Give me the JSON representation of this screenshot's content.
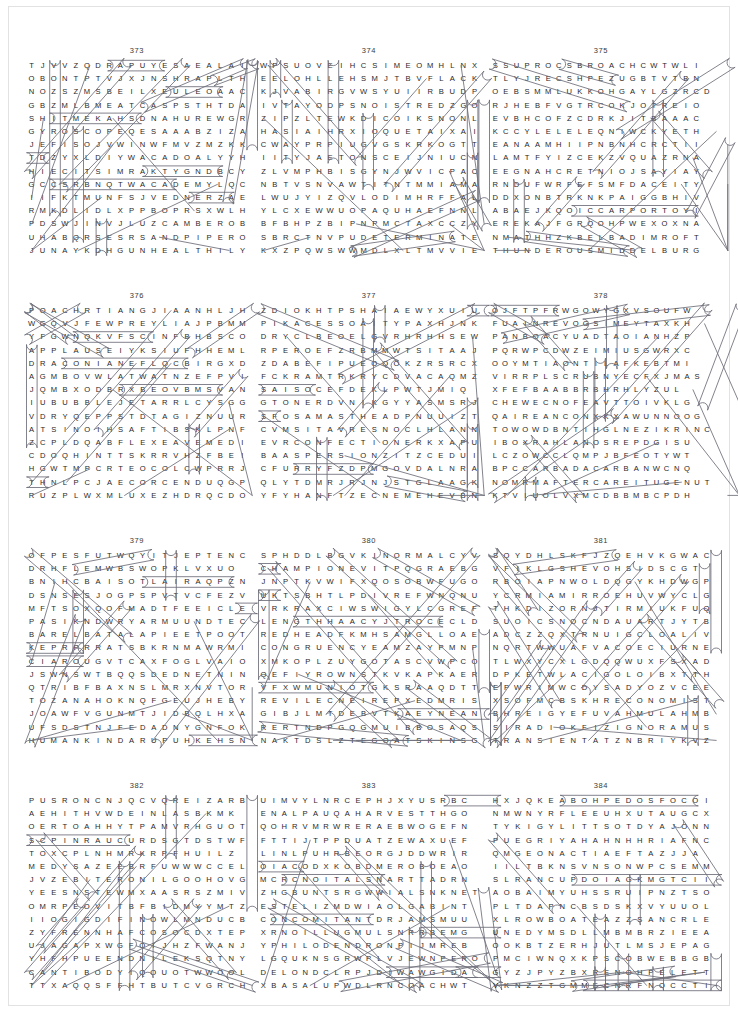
{
  "page": {
    "kind": "word-search-puzzle-sheet",
    "layout": {
      "rows": 4,
      "columns": 3,
      "puzzles_total": 12
    },
    "first_puzzle_number": "373",
    "last_puzzle_number": "384"
  },
  "puzzles": [
    {
      "number": "373",
      "grid": [
        "TJVVZQDRAPUYESAEALAI",
        "OBONTPTVJXJNSHRAPLTH",
        "NOZSZMSBEILXEULEOAAC",
        "GBZMLBMEATCASPSTHTDA",
        "SHITMEKAHSDNAHUREWGR",
        "GYROSCOPEQESAAABZIZA",
        "JEFISOJVWINWFMVZMZKK",
        "TDZYXLDIYWACADOALYYH",
        "HIECITSIMRAKTYGNDBCY",
        "GCCSRBNQTWACADEMYLQC",
        "IIFKTMUNFSJVEDNERZAE",
        "RMKDLIDLXPPBOPRSXWLH",
        "PDSWJINVJLUZCAMBEROB",
        "UHABQRSESRSANDPIPERO",
        "JUNAYKDHGUNHEALTHILY"
      ],
      "found_words": [
        "GYROSCOPE",
        "SANDHANDS",
        "CAMBER",
        "SANDPIPER",
        "UNHEALTHILY",
        "ACADEMY",
        "KARMISTICE",
        "GOSSIP",
        "TONGS",
        "STONING"
      ]
    },
    {
      "number": "374",
      "grid": [
        "WPSUOVEIHCSIMEOMHLNX",
        "EELOHLLEHSMJTBVFLACK",
        "KJVABIRGVWSYUIIRBUDP",
        "IVTAYODPSNOISTREDZGO",
        "ZIPZLTEWKDICOIKSNONL",
        "HASIAIHRXIOQUETAIXAI",
        "CWAYPRPIUGVGSKRKOGTT",
        "IITYJAETONSCEIJNIUCN",
        "ZLVMPHBISGYNJWVICPAC",
        "NBTVSNVAWTITNTMMIAMA",
        "LWUJYIZQVLODIMHRFFAL",
        "YLCXEWWUOPAQUHAEFNNL",
        "BFBHPZBIPNPMCTAXCCZY",
        "SBRCTNVPUDETERMINATE",
        "KXZPQWSWWMDLXLTMVVIE"
      ],
      "found_words": [
        "MISCHIEVOUS",
        "SHELL HOLE",
        "FLACK",
        "DERISION",
        "DETERMINATE",
        "ETIQUETTE"
      ]
    },
    {
      "number": "375",
      "grid": [
        "SSUPROCSBROACHCWTWLI",
        "TLYJRECSHPEZUGBTVTBN",
        "OEBSMMLUKKOHGAYLGZRCD",
        "RJHEBFVGTRCOKJOTREIO",
        "EVBHCOFZCDRKJITBAAAC",
        "KCCYLELELEQNIWCKYETH",
        "EANAAMHIIPNBNHCRCTII",
        "LAMTFYIZCEKZVQUAZRNA",
        "EEGNAHCRETNIOJSAYIAY",
        "RNDUFWRFEFSMFDACEITY",
        "DDXONBTRKNKPAIGGBHIV",
        "ABAEJKQOICCARPORTOYI",
        "EREKAJFGRQOHPWEXOXNA",
        "NMATHHZKBELBADIMROFT",
        "THUNDEROUSMIDDELBURG"
      ],
      "found_words": [
        "CORPUS",
        "BROACH",
        "INTERCHANGE",
        "CARPORT",
        "FORMIDABLE",
        "THUNDEROUS",
        "MIDDELBURG",
        "STOREKEEPER"
      ]
    },
    {
      "number": "376",
      "grid": [
        "POACHRTIANGJIAANHLJH",
        "WGQVJFEWPREYLIAJPBMM",
        "YFGWNQKVFSCINFBHBSCO",
        "APPLAUSEIYKSIUFHHEML",
        "DRACONIANEFLQCBIRGXD",
        "AGMBOVWLATWATNZEFPVI",
        "JQMBXODBRXBEOVBMSVAN",
        "IUBUBBLEJETARRLCYSGG",
        "VDRYQEPPSTDTAGIZNUUR",
        "ATSINOIHSAFTIBSKLPNF",
        "ZCPLDQABFLEXEAVEMEDI",
        "CDOQHINTTSKRRVHZFBEI",
        "HGWTMPCRTEOCOLCWPRRJ",
        "THNLPCJAECORCENDUQGP",
        "RUZPLWXMLUXEZHDRQCDO"
      ],
      "found_words": [
        "POACH",
        "APPLAUSE",
        "DRACONIAN",
        "BUBBLE JET",
        "FASHIONIST",
        "FLEXEAVE",
        "CORCEND"
      ]
    },
    {
      "number": "377",
      "grid": [
        "ZDIOKHTPSHAIAEWYXUIU",
        "PIKACESSOAITYPAXHJNK",
        "DRYCLBEOELGVRHRHHSEW",
        "RPEROEFZRBMMWTSITAAJ",
        "ZDABEFIPUEOQOKZRSRCX",
        "FCKRAMTRKRYCDVACAQMZ",
        "SAISOCEFDEKLPWTJMIQ",
        "GTONERDVNIKGYYASMSRJ",
        "SFOSAMASTHEADPNUUIZT",
        "CVMSITAVRESNOCLHLANN",
        "EVRCONFECTIONERKXAPU",
        "BAASPERSIONZITZCEDUI",
        "CFURRYFZDPMGOVDALNRA",
        "QLYTDMRJRJNJSTGLAAGK",
        "YFYHANFTZECNEMEHEVBN"
      ],
      "found_words": [
        "MASTHEAD",
        "CONSERVATISM",
        "CONFECTIONER",
        "ASPERSION",
        "FURRY",
        "VEHEMENCE",
        "ACCESS",
        "TONER"
      ]
    },
    {
      "number": "378",
      "grid": [
        "OJFTPFRWGOWYGXVSOUFW",
        "FUAINREVOGSIMEYTAXKH",
        "PANBOACYUADTAOIANHZP",
        "PQRWPCDWZEIMIUSGWRXC",
        "OOYMTIAONTILAFKEBTMI",
        "VIRRPLSCRUBNYECFXJMAS",
        "XFEFBAABBRBHRHLYZUL",
        "CHEWECNOFEAVTTOIVKLG",
        "QAIREANCONXKXAWUNNOOG",
        "TOWOWDBNTIHGLNEZIKRINC",
        "IBOXRAHLANOSREPDGISU",
        "LCZOWCCLQMPJBFEOTYWT",
        "BPCCARBADACARBANWCNQ",
        "NOMRMAFTERCAREITUGENUT",
        "KTVIUOLVXMCDBBMBCPDH"
      ],
      "found_words": [
        "MISGOVERN",
        "SCRUB",
        "PERSONAL",
        "CARBADACARB",
        "AFTERCARE",
        "JIBE",
        "GIANT"
      ]
    },
    {
      "number": "379",
      "grid": [
        "OFPESFUTWQYITJEPTENC",
        "DRHFLEMWBSWOPKLVXUO",
        "BNIHCBAISOTLAIRAQPZN",
        "DSNSESJOGPSPVTVCFEZV",
        "MFTSOXQOFMADTFEEICLE",
        "PASIKNDWRYARMUUNDTEC",
        "BARELBATALAPIEETPOOT",
        "KEPRPRRATSBKRNMAWRMI",
        "CIAROUGVTCAXFOGLVAIO",
        "JSWNSWTBQQSDEDNETNIN",
        "QTRIBFBAXNSLMRXNVTOR",
        "TOZANAHOKNQFGEUJHEBY",
        "JOAWFVGUNMTJIDBQLHXA",
        "UFSDSTNJFEDADNYGNFOK",
        "HUMANKINDARUPUHKEHSN"
      ],
      "found_words": [
        "PALATABLE",
        "INTENDED",
        "HUMANKIND",
        "PURA",
        "TOTALITARIAN",
        "POTENCIES"
      ]
    },
    {
      "number": "380",
      "grid": [
        "SPHDDLBGVKINORMALCYV",
        "CHAMPIONEVITPQGRAEBG",
        "JNPTKVWIFXQOSOBWFUGO",
        "UKTSBHTLPDIVREFWNQNU",
        "VRKRAXCIWSWIGYLCGREF",
        "LENGTHHAACYJTROCECLD",
        "REDHEADFKMHSAMGLLOAE",
        "CONGRUENCYEAMZAYPMNP",
        "XMKOPLZUYGOTASCVWPCO",
        "QEFIYROWNSTKVKAPKAER",
        "VFXWMUNIOTGKSRAAQDTT",
        "REVILECNEIREPXEDMRIS",
        "GIBJLMTDEBVTKAEYNEAN",
        "RERTNDPGQGMUIBBOSAQS",
        "NAKTDSLZTEGOATSKINSG"
      ],
      "found_words": [
        "NORMALCY",
        "CHAMPION",
        "LENGTH",
        "REDHEAD",
        "CONGRUENCY",
        "EXPERIENCE",
        "REVILE",
        "GOATSKINS"
      ]
    },
    {
      "number": "381",
      "grid": [
        "SQYDHLSKFJZQEHVKGWAC",
        "VFIKLGSHEVOHSIDSCGT",
        "RBOIAPNWOLDQGYKHDWGP",
        "YCRMIAMIRROEHUVWYCLG",
        "THKDIZORNJTIRMIUKFUQ",
        "SUOICSNOCNDAUARTJYTB",
        "ADCZZQXTRNUIGCLOALIV",
        "NQRTWWUAFVACOECIURNE",
        "TLWXYCXLGDQQWUXFSXAD",
        "DPKETWLACIGOLOIBXTTH",
        "EPWRIMWCDYSADYOZVCEE",
        "XSOFMCBSKHRECONOMIST",
        "BHREIGYEFUVAHMULAHMB",
        "SIRADIOKFIZIGNORAMUS",
        "TRANSIENTATZNBRIYKVZ"
      ],
      "found_words": [
        "SHOVE",
        "MIAMI",
        "CONSCIOUS",
        "LOGICAL",
        "ECONOMIST",
        "HALUMAHVUF",
        "RADIO",
        "IGNORAMUS",
        "TRANSIENT"
      ]
    },
    {
      "number": "382",
      "grid": [
        "PUSRONCNJQCVQREIZARB",
        "AEHITHVWDEINLASBKMK",
        "OERTOAHHYTPAMVRHGUOT",
        "SCPINRAUCURDSGTDSTWF",
        "TOXCPLNHMRKRPFHUILZ",
        "MEDYSAZEEBRFUWWWCCEL",
        "JVZEBITERONILGOOHOVG",
        "YEESNSTEWMXAASRSZMIV",
        "OMRPEOVITBFBIDMYYMTZ",
        "IIOGIGDIFINOWLMNDUCB",
        "ZYFRENNHAFCOSOCDXTEP",
        "UJAGAPXWGFOIJHZFWANJ",
        "YHFHPUEENDNILEKSQTNY",
        "CANTIBODYIQOUOTWWOOL",
        "TTXAQQSFFHTBUTCVGRCH"
      ],
      "found_words": [
        "NORSUP",
        "BRAZIER",
        "TOUGH",
        "CURDS",
        "ANTIBODY",
        "MEDYS"
      ]
    },
    {
      "number": "383",
      "grid": [
        "UIMVYLNRCEPHJXYUSRBC",
        "ENALPAUQAHARVESTTHGO",
        "QOHRVMRWRERAEBWOGEFN",
        "FTTIJTPPDUATZEWAXUEF",
        "LINLPUHRBEORGJDDWRIR",
        "OIACODXKOBDMEROBOEAO",
        "MCRCNOITALSNARTTADRN",
        "ZHGBUNTSRGWWIALSNKNET",
        "ESTELIZMDWIAOLGABINT",
        "CONCOMITANTDRJAMSMUU",
        "XRNOILLUGMULSNRRBEMG",
        "YPHILODENDRONPIJMREB",
        "LGQUKNSGRWPLVJEWNPERO",
        "DELONDCLRPJDIWAWGIDA",
        "XBASALUPWDLRNCOACHWT"
      ],
      "found_words": [
        "AQUAPLANE",
        "HARVEST",
        "BEARER",
        "TRANSLATION",
        "ILETSE",
        "CONCOMITANT",
        "SLUMGULLION",
        "PHILODENDRON",
        "COACH"
      ]
    },
    {
      "number": "384",
      "grid": [
        "HXJQKEABOHPEDOSFOCOI",
        "NMWNYRFLEEUHXUTAUGCX",
        "TYKIGYLITTSOTDYAJONN",
        "PUEGRIYAHAHNHHRIAFNC",
        "QMGEONACTIAEFTAZJJA",
        "IILTBKNSVNSONWPCSEMM",
        "SLRANCUPDOIAGKMGTCII",
        "AOBAIMYUHSSRUIPNZTSO",
        "PLTDAPNCBSDSKXVYUUOL",
        "XLROWBOATEAZZSANCRLE",
        "UNEDYMSDLLMBMBRZIEEA",
        "OOKBTZERHJUTLMSJEPAG",
        "PMCIWNQXKPSCOBWEBBGB",
        "GYZJPYZBXRENOHPELETT",
        "VKNZZTGMMECNRFNOCCTI"
      ],
      "found_words": [
        "ROWBOAT",
        "COBWEB",
        "TELEPHONE",
        "CONFERENCE",
        "DOPE",
        "ELBOW"
      ]
    }
  ]
}
